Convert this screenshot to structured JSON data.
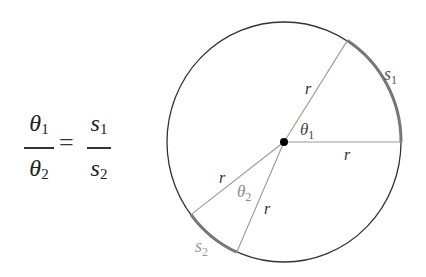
{
  "formula": {
    "left_fraction": {
      "numerator": "θ",
      "numerator_sub": "1",
      "denominator": "θ",
      "denominator_sub": "2"
    },
    "equals": "=",
    "right_fraction": {
      "numerator": "s",
      "numerator_sub": "1",
      "denominator": "s",
      "denominator_sub": "2"
    }
  },
  "diagram": {
    "circle": {
      "cx": 284,
      "cy": 142,
      "rx": 117,
      "ry": 120,
      "stroke": "#333333"
    },
    "center_dot": {
      "cx": 284,
      "cy": 142,
      "r": 4,
      "fill": "#000000"
    },
    "radius_color": "#999999",
    "arc_color": "#777777",
    "labels": {
      "r_upper": "r",
      "r_horizontal": "r",
      "r_left": "r",
      "r_lower": "r",
      "theta1": "θ",
      "theta1_sub": "1",
      "theta2": "θ",
      "theta2_sub": "2",
      "s1": "s",
      "s1_sub": "1",
      "s2": "s",
      "s2_sub": "2"
    }
  }
}
